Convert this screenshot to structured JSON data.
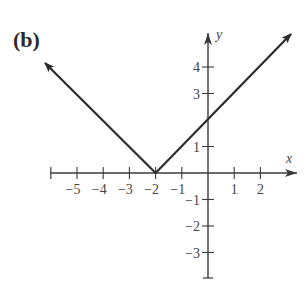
{
  "figure_label": "(b)",
  "chart_data": {
    "type": "line",
    "title": "",
    "xlabel": "x",
    "ylabel": "y",
    "function": "y = |x + 2|",
    "series": [
      {
        "name": "y = |x+2|",
        "x": [
          -6,
          -2,
          3.2
        ],
        "y": [
          4,
          0,
          5.2
        ]
      }
    ],
    "vertex": [
      -2,
      0
    ],
    "y_intercept": [
      0,
      2
    ],
    "xlim": [
      -6.1,
      3.4
    ],
    "ylim": [
      -4,
      5.2
    ],
    "x_ticks": [
      -6,
      -5,
      -4,
      -3,
      -2,
      -1,
      1,
      2
    ],
    "x_tick_labels": [
      "-5",
      "-4",
      "-3",
      "-2",
      "-1",
      "1",
      "2"
    ],
    "y_ticks": [
      -3,
      -2,
      -1,
      1,
      3,
      4
    ],
    "y_tick_labels": [
      "4",
      "3",
      "1",
      "-1",
      "-2",
      "-3"
    ],
    "grid": false,
    "legend": null
  },
  "axis": {
    "x_name": "x",
    "y_name": "y"
  },
  "tick_labels": {
    "x": [
      {
        "v": -5,
        "t": "−5"
      },
      {
        "v": -4,
        "t": "−4"
      },
      {
        "v": -3,
        "t": "−3"
      },
      {
        "v": -2,
        "t": "−2"
      },
      {
        "v": -1,
        "t": "−1"
      },
      {
        "v": 1,
        "t": "1"
      },
      {
        "v": 2,
        "t": "2"
      }
    ],
    "y": [
      {
        "v": 4,
        "t": "4"
      },
      {
        "v": 3,
        "t": "3"
      },
      {
        "v": 1,
        "t": "1"
      },
      {
        "v": -1,
        "t": "−1"
      },
      {
        "v": -2,
        "t": "−2"
      },
      {
        "v": -3,
        "t": "−3"
      }
    ]
  },
  "colors": {
    "line": "#2b2b2b",
    "axis": "#3a3a3a",
    "text": "#444444"
  }
}
